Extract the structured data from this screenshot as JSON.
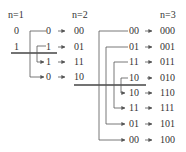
{
  "headers": {
    "n1": "n=1",
    "n2": "n=2",
    "n3": "n=3"
  },
  "n1": {
    "codes": [
      "0",
      "1"
    ]
  },
  "n2": {
    "reflected": [
      "0",
      "1",
      "1",
      "0"
    ],
    "results": [
      "00",
      "01",
      "11",
      "10"
    ]
  },
  "n3": {
    "reflected": [
      "00",
      "01",
      "11",
      "10",
      "10",
      "11",
      "01",
      "00"
    ],
    "results": [
      "000",
      "001",
      "011",
      "010",
      "110",
      "111",
      "101",
      "100"
    ]
  },
  "arrow_glyph": "→",
  "colors": {
    "line": "#555555",
    "mirror": "#444444",
    "text": "#333333"
  }
}
